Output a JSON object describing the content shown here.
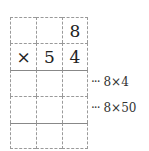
{
  "multiplication": {
    "rows": [
      [
        "",
        "",
        "8"
      ],
      [
        "×",
        "5",
        "4"
      ],
      [
        "",
        "",
        ""
      ],
      [
        "",
        "",
        ""
      ],
      [
        "",
        "",
        ""
      ]
    ],
    "solid_lines_above_rows": [
      2,
      4
    ]
  },
  "annotations": [
    {
      "dots": "···",
      "text": "8×4"
    },
    {
      "dots": "···",
      "text": "8×50"
    }
  ]
}
